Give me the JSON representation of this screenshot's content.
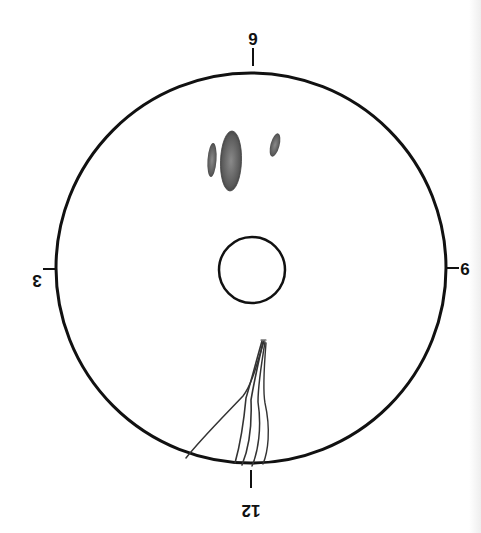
{
  "diagram": {
    "labels": {
      "top": "9",
      "right": "6",
      "bottom": "12",
      "left": "3"
    },
    "colors": {
      "outline": "#111111",
      "lesion_fill": "#555555",
      "lesion_dark": "#3a3a3a",
      "strand": "#333333",
      "background": "#ffffff"
    },
    "elements": {
      "outer_circle": "outer boundary",
      "inner_circle": "central disc",
      "lesions": [
        "small lesion left",
        "large lesion center",
        "small lesion right"
      ],
      "strands": [
        "long diagonal strand",
        "strand 1",
        "strand 2",
        "strand 3",
        "strand 4"
      ]
    }
  }
}
